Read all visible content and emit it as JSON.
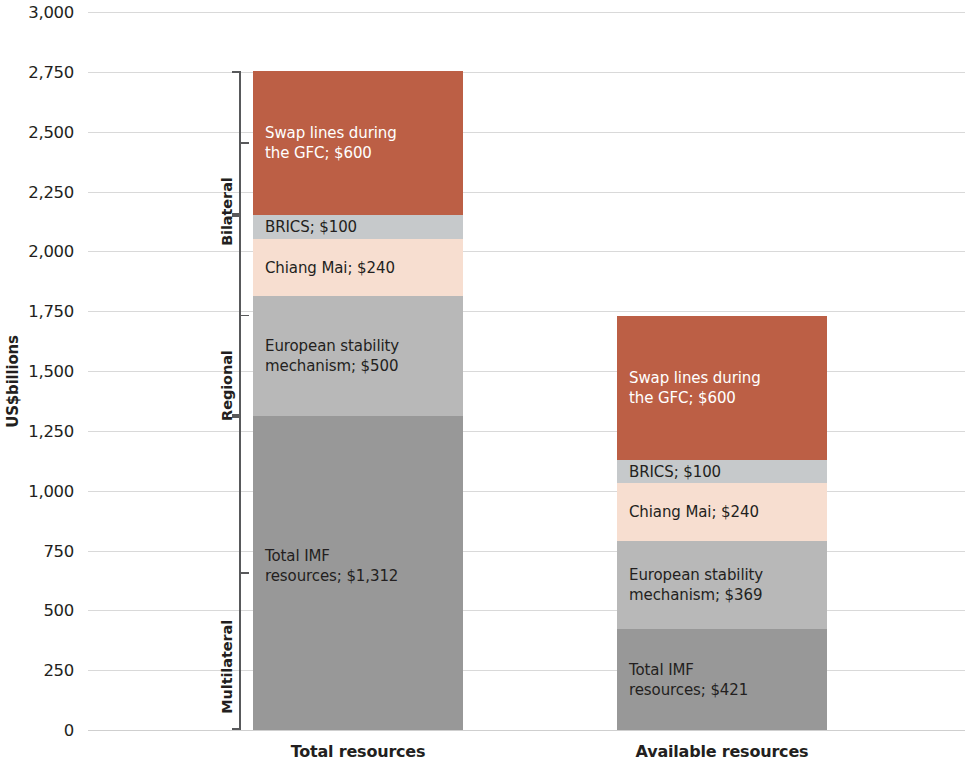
{
  "chart_data": {
    "type": "bar",
    "subtype": "stacked-bar",
    "title": "",
    "xlabel": "",
    "ylabel": "US$billions",
    "ylim": [
      0,
      3000
    ],
    "ytick_step": 250,
    "ytick_labels": [
      "3,000",
      "2,750",
      "2,500",
      "2,250",
      "2,000",
      "1,750",
      "1,500",
      "1,250",
      "1,000",
      "750",
      "500",
      "250",
      "0"
    ],
    "ytick_values": [
      3000,
      2750,
      2500,
      2250,
      2000,
      1750,
      1500,
      1250,
      1000,
      750,
      500,
      250,
      0
    ],
    "grid": true,
    "legend": "none (in-segment data labels)",
    "categories": [
      "Total resources",
      "Available resources"
    ],
    "series": [
      {
        "name": "Total IMF resources",
        "group": "Multilateral",
        "color": "#989898",
        "values": [
          1312,
          421
        ],
        "labels": [
          "Total IMF\nresources;  $1,312",
          "Total IMF\nresources;  $421"
        ]
      },
      {
        "name": "European stability mechanism",
        "group": "Regional",
        "color": "#b8b8b8",
        "values": [
          500,
          369
        ],
        "labels": [
          "European stability\nmechanism;  $500",
          "European stability\nmechanism;  $369"
        ]
      },
      {
        "name": "Chiang Mai",
        "group": "Regional",
        "color": "#f7ded0",
        "values": [
          240,
          240
        ],
        "labels": [
          "Chiang Mai;  $240",
          "Chiang Mai;  $240"
        ]
      },
      {
        "name": "BRICS",
        "group": "Regional",
        "color": "#c6c9cb",
        "values": [
          100,
          100
        ],
        "labels": [
          "BRICS;  $100",
          "BRICS;  $100"
        ]
      },
      {
        "name": "Swap lines during the GFC",
        "group": "Bilateral",
        "color": "#bc5f45",
        "values": [
          600,
          600
        ],
        "labels": [
          "Swap lines during\nthe GFC;  $600",
          "Swap lines during\nthe GFC;  $600"
        ]
      }
    ],
    "totals": [
      2752,
      1730
    ],
    "groups": [
      {
        "label": "Multilateral",
        "from": 0,
        "to": 1312
      },
      {
        "label": "Regional",
        "from": 1312,
        "to": 2152
      },
      {
        "label": "Bilateral",
        "from": 2152,
        "to": 2752
      }
    ],
    "colors": {
      "terracotta": "#bc5f45",
      "brics_gray": "#c6c9cb",
      "chiang_mai_peach": "#f7ded0",
      "esm_gray": "#b8b8b8",
      "imf_gray": "#989898",
      "gridline": "#d9d9d9",
      "text": "#231f20",
      "bracket": "#58595b"
    }
  }
}
